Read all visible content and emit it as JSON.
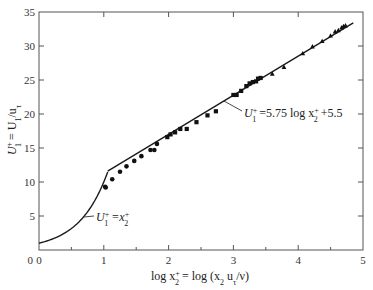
{
  "chart_data": {
    "type": "scatter",
    "title": "",
    "xlabel": "log x2+ = log (x2 uτ/ν)",
    "ylabel": "U1+ = U1/uτ",
    "xlim": [
      0,
      5
    ],
    "ylim": [
      0,
      35
    ],
    "xticks": [
      0,
      1,
      2,
      3,
      4,
      5
    ],
    "xticks_minor": [
      0.5,
      1.5,
      2.5,
      3.5,
      4.5
    ],
    "yticks": [
      5,
      10,
      15,
      20,
      25,
      30,
      35
    ],
    "grid": false,
    "legend": "none",
    "series": [
      {
        "name": "data (circles)",
        "marker": "circle",
        "x": [
          1.02,
          1.03,
          1.13,
          1.25,
          1.35,
          1.47,
          1.58,
          1.72,
          1.78,
          1.82
        ],
        "y": [
          9.3,
          9.2,
          10.4,
          11.5,
          12.3,
          13.1,
          13.8,
          14.7,
          14.7,
          15.6
        ]
      },
      {
        "name": "data (squares)",
        "marker": "square",
        "x": [
          1.98,
          2.03,
          2.1,
          2.18,
          2.28,
          2.43,
          2.6,
          2.73,
          3.0,
          3.05,
          3.12,
          3.2,
          3.25,
          3.3,
          3.35,
          3.38,
          3.42
        ],
        "y": [
          16.6,
          17.0,
          17.3,
          17.8,
          17.8,
          18.8,
          19.8,
          20.4,
          22.8,
          22.8,
          23.4,
          24.1,
          24.5,
          24.7,
          24.8,
          25.2,
          25.3
        ]
      },
      {
        "name": "data (triangles)",
        "marker": "triangle",
        "x": [
          3.6,
          3.78,
          4.07,
          4.22,
          4.37,
          4.5,
          4.57,
          4.62,
          4.67,
          4.7,
          4.73
        ],
        "y": [
          25.9,
          26.9,
          28.9,
          29.9,
          30.7,
          31.5,
          32.1,
          32.3,
          32.7,
          32.9,
          33.0
        ]
      },
      {
        "name": "viscous sublayer U1+ = x2+",
        "type": "line",
        "x": [
          0,
          0.2,
          0.4,
          0.6,
          0.7,
          0.8,
          0.9,
          1.0,
          1.06
        ],
        "y": [
          1.0,
          1.58,
          2.51,
          3.98,
          5.01,
          6.31,
          7.94,
          10.0,
          11.5
        ]
      },
      {
        "name": "log law U1+ = 5.75 log x2+ + 5.5",
        "type": "line",
        "x": [
          1.06,
          4.85
        ],
        "y": [
          11.6,
          33.4
        ]
      }
    ],
    "annotations": [
      {
        "text": "U1+ = x2+",
        "x": 0.82,
        "y": 4.8
      },
      {
        "text": "U1+ = 5.75 log x2+ + 5.5",
        "x": 3.2,
        "y": 20.1
      }
    ]
  },
  "labels": {
    "x_axis_prefix": "log x",
    "x_axis_rest": " = log (x",
    "x_axis_mid": " u",
    "x_axis_end": "/ν)",
    "y_axis_main": "U",
    "y_axis_rest": " = U",
    "y_axis_div": "/u",
    "annot_low": "U",
    "annot_low_rest": " =x",
    "annot_high": "U",
    "annot_high_rest": " =5.75 log x",
    "annot_high_end": " +5.5",
    "sup_plus": "+",
    "sub_1": "1",
    "sub_2": "2",
    "sub_tau": "τ"
  },
  "style": {
    "line_color": "#1a1a1a",
    "marker_color": "#111111",
    "axis_color": "#555555"
  }
}
